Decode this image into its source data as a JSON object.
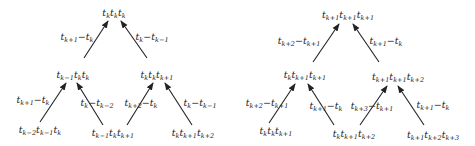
{
  "trees": [
    {
      "id": "left",
      "nodes": [
        {
          "key": "root",
          "x": 114,
          "y": 13,
          "terms": [
            [
              "t",
              "k"
            ],
            [
              "t",
              "k"
            ],
            [
              "t",
              "k"
            ]
          ]
        },
        {
          "key": "mid-left",
          "x": 73,
          "y": 75,
          "terms": [
            [
              "t",
              "k−1"
            ],
            [
              "t",
              "k"
            ],
            [
              "t",
              "k"
            ]
          ]
        },
        {
          "key": "mid-right",
          "x": 157,
          "y": 75,
          "terms": [
            [
              "t",
              "k"
            ],
            [
              "t",
              "k"
            ],
            [
              "t",
              "k+1"
            ]
          ]
        },
        {
          "key": "leaf-1",
          "x": 40,
          "y": 130,
          "terms": [
            [
              "t",
              "k−2"
            ],
            [
              "t",
              "k−1"
            ],
            [
              "t",
              "k"
            ]
          ]
        },
        {
          "key": "leaf-2",
          "x": 113,
          "y": 133,
          "terms": [
            [
              "t",
              "k−1"
            ],
            [
              "t",
              "k"
            ],
            [
              "t",
              "k+1"
            ]
          ]
        },
        {
          "key": "leaf-3",
          "x": 193,
          "y": 133,
          "terms": [
            [
              "t",
              "k"
            ],
            [
              "t",
              "k+1"
            ],
            [
              "t",
              "k+2"
            ]
          ]
        }
      ],
      "edges": [
        {
          "from": [
            84,
            58
          ],
          "to": [
            108,
            21
          ],
          "label": [
            [
              "t",
              "k+1"
            ],
            "−",
            [
              "t",
              "k"
            ]
          ],
          "lx": 77,
          "ly": 37
        },
        {
          "from": [
            147,
            58
          ],
          "to": [
            121,
            21
          ],
          "label": [
            [
              "t",
              "k"
            ],
            "−",
            [
              "t",
              "k−1"
            ]
          ],
          "lx": 152,
          "ly": 37
        },
        {
          "from": [
            40,
            122
          ],
          "to": [
            66,
            83
          ],
          "label": [
            [
              "t",
              "k+1"
            ],
            "−",
            [
              "t",
              "k"
            ]
          ],
          "lx": 33,
          "ly": 100
        },
        {
          "from": [
            103,
            125
          ],
          "to": [
            77,
            83
          ],
          "label": [
            [
              "t",
              "k"
            ],
            "−",
            [
              "t",
              "k−2"
            ]
          ],
          "lx": 97,
          "ly": 103
        },
        {
          "from": [
            127,
            125
          ],
          "to": [
            153,
            83
          ],
          "label": [
            [
              "t",
              "k+2"
            ],
            "−",
            [
              "t",
              "k"
            ]
          ],
          "lx": 141,
          "ly": 103
        },
        {
          "from": [
            192,
            125
          ],
          "to": [
            165,
            83
          ],
          "label": [
            [
              "t",
              "k"
            ],
            "−",
            [
              "t",
              "k−1"
            ]
          ],
          "lx": 200,
          "ly": 103
        }
      ]
    },
    {
      "id": "right",
      "nodes": [
        {
          "key": "root",
          "x": 348,
          "y": 15,
          "terms": [
            [
              "t",
              "k+1"
            ],
            [
              "t",
              "k+1"
            ],
            [
              "t",
              "k+1"
            ]
          ]
        },
        {
          "key": "mid-left",
          "x": 305,
          "y": 75,
          "terms": [
            [
              "t",
              "k"
            ],
            [
              "t",
              "k+1"
            ],
            [
              "t",
              "k+1"
            ]
          ]
        },
        {
          "key": "mid-right",
          "x": 398,
          "y": 77,
          "terms": [
            [
              "t",
              "k+1"
            ],
            [
              "t",
              "k+1"
            ],
            [
              "t",
              "k+2"
            ]
          ]
        },
        {
          "key": "leaf-1",
          "x": 276,
          "y": 131,
          "terms": [
            [
              "t",
              "k"
            ],
            [
              "t",
              "k"
            ],
            [
              "t",
              "k+1"
            ]
          ]
        },
        {
          "key": "leaf-2",
          "x": 354,
          "y": 134,
          "terms": [
            [
              "t",
              "k"
            ],
            [
              "t",
              "k+1"
            ],
            [
              "t",
              "k+2"
            ]
          ]
        },
        {
          "key": "leaf-3",
          "x": 433,
          "y": 135,
          "terms": [
            [
              "t",
              "k+1"
            ],
            [
              "t",
              "k+2"
            ],
            [
              "t",
              "k+3"
            ]
          ]
        }
      ],
      "edges": [
        {
          "from": [
            313,
            62
          ],
          "to": [
            339,
            24
          ],
          "label": [
            [
              "t",
              "k+2"
            ],
            "−",
            [
              "t",
              "k+1"
            ]
          ],
          "lx": 299,
          "ly": 41
        },
        {
          "from": [
            379,
            62
          ],
          "to": [
            353,
            24
          ],
          "label": [
            [
              "t",
              "k+1"
            ],
            "−",
            [
              "t",
              "k"
            ]
          ],
          "lx": 386,
          "ly": 41
        },
        {
          "from": [
            269,
            123
          ],
          "to": [
            295,
            84
          ],
          "label": [
            [
              "t",
              "k+2"
            ],
            "−",
            [
              "t",
              "k+1"
            ]
          ],
          "lx": 267,
          "ly": 103
        },
        {
          "from": [
            334,
            125
          ],
          "to": [
            308,
            84
          ],
          "label": [
            [
              "t",
              "k+1"
            ],
            "−",
            [
              "t",
              "k"
            ]
          ],
          "lx": 326,
          "ly": 106
        },
        {
          "from": [
            360,
            125
          ],
          "to": [
            387,
            86
          ],
          "label": [
            [
              "t",
              "k+3"
            ],
            "−",
            [
              "t",
              "k+1"
            ]
          ],
          "lx": 372,
          "ly": 106
        },
        {
          "from": [
            424,
            125
          ],
          "to": [
            398,
            86
          ],
          "label": [
            [
              "t",
              "k+1"
            ],
            "−",
            [
              "t",
              "k"
            ]
          ],
          "lx": 433,
          "ly": 105
        }
      ]
    }
  ],
  "colors": {
    "ink": "#222222",
    "background": "#ffffff"
  }
}
